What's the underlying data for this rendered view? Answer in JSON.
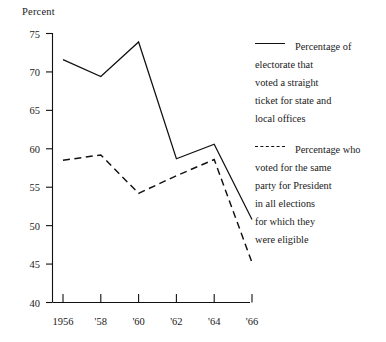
{
  "chart_data": {
    "type": "line",
    "title": "",
    "xlabel": "",
    "ylabel": "Percent",
    "ylim": [
      40,
      75
    ],
    "yticks": [
      40,
      45,
      50,
      55,
      60,
      65,
      70,
      75
    ],
    "ytick_labels": [
      "40",
      "45",
      "50",
      "55",
      "60",
      "65",
      "70",
      "75"
    ],
    "x": [
      1956,
      1958,
      1960,
      1962,
      1964,
      1966
    ],
    "xtick_labels": [
      "1956",
      "'58",
      "'60",
      "'62",
      "'64",
      "'66"
    ],
    "grid": false,
    "legend_position": "right",
    "series": [
      {
        "name": "Percentage of electorate that voted a straight ticket for state and local offices",
        "style": "solid",
        "color": "#111111",
        "values": [
          71.6,
          69.4,
          73.9,
          58.7,
          60.6,
          50.8
        ]
      },
      {
        "name": "Percentage who voted for the same party for President in all elections for which they were eligible",
        "style": "dashed",
        "color": "#111111",
        "values": [
          58.5,
          59.2,
          54.2,
          56.5,
          58.6,
          45.2
        ]
      }
    ]
  },
  "legend": {
    "entries": [
      {
        "marker": "solid-line-swatch",
        "label": "Percentage of\nelectorate that\nvoted a straight\nticket for state and\nlocal offices"
      },
      {
        "marker": "dashed-line-swatch",
        "label": "Percentage who\nvoted for the same\nparty for President\nin all elections\nfor which they\nwere eligible"
      }
    ]
  }
}
